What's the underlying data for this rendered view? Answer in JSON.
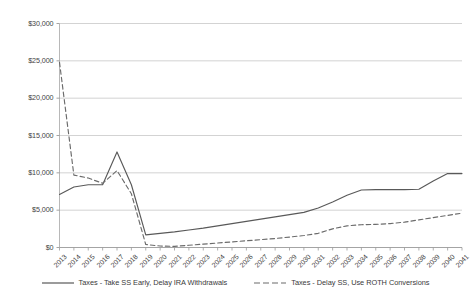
{
  "chart_data": {
    "type": "line",
    "title": "",
    "xlabel": "",
    "ylabel": "",
    "ylim": [
      0,
      30000
    ],
    "ytick_labels": [
      "$30,000",
      "$25,000",
      "$20,000",
      "$15,000",
      "$10,000",
      "$5,000",
      "$0"
    ],
    "ytick_values": [
      30000,
      25000,
      20000,
      15000,
      10000,
      5000,
      0
    ],
    "grid": true,
    "legend_position": "bottom",
    "categories": [
      "2013",
      "2014",
      "2015",
      "2016",
      "2017",
      "2018",
      "2019",
      "2020",
      "2021",
      "2022",
      "2023",
      "2024",
      "2025",
      "2026",
      "2027",
      "2028",
      "2029",
      "2030",
      "2031",
      "2032",
      "2033",
      "2034",
      "2035",
      "2036",
      "2037",
      "2038",
      "2039",
      "2040",
      "2041"
    ],
    "series": [
      {
        "name": "Taxes - Take SS Early, Delay IRA Withdrawals",
        "style": "solid",
        "color": "#595959",
        "values": [
          7100,
          8100,
          8400,
          8400,
          12800,
          8400,
          1700,
          1900,
          2100,
          2350,
          2600,
          2900,
          3200,
          3500,
          3800,
          4100,
          4400,
          4700,
          5300,
          6100,
          7000,
          7700,
          7750,
          7750,
          7750,
          7800,
          8900,
          9900,
          9900
        ]
      },
      {
        "name": "Taxes - Delay SS, Use ROTH Conversions",
        "style": "dashed",
        "color": "#6b6b6b",
        "values": [
          24800,
          9700,
          9300,
          8600,
          10300,
          7200,
          400,
          200,
          150,
          300,
          450,
          600,
          750,
          900,
          1050,
          1200,
          1400,
          1600,
          1900,
          2500,
          2900,
          3050,
          3100,
          3200,
          3400,
          3700,
          4000,
          4300,
          4600
        ]
      }
    ]
  },
  "legend": {
    "entries": [
      {
        "label": "Taxes - Take SS Early, Delay IRA Withdrawals",
        "style": "solid"
      },
      {
        "label": "Taxes - Delay SS, Use ROTH Conversions",
        "style": "dashed"
      }
    ]
  }
}
